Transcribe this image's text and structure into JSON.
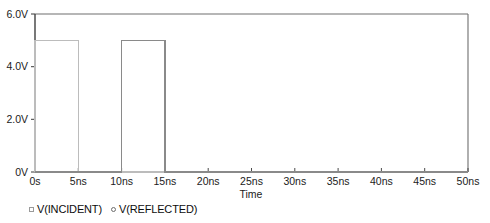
{
  "chart_data": {
    "type": "line",
    "title": "",
    "xlabel": "Time",
    "ylabel": "",
    "xlim": [
      0,
      50
    ],
    "ylim": [
      0,
      6
    ],
    "x_unit": "ns",
    "y_unit": "V",
    "grid": false,
    "legend_position": "bottom-left",
    "x_ticks": [
      0,
      5,
      10,
      15,
      20,
      25,
      30,
      35,
      40,
      45,
      50
    ],
    "x_tick_labels": [
      "0s",
      "5ns",
      "10ns",
      "15ns",
      "20ns",
      "25ns",
      "30ns",
      "35ns",
      "40ns",
      "45ns",
      "50ns"
    ],
    "y_ticks": [
      0,
      2,
      4,
      6
    ],
    "y_tick_labels": [
      "0V",
      "2.0V",
      "4.0V",
      "6.0V"
    ],
    "series": [
      {
        "name": "V(INCIDENT)",
        "marker": "square",
        "color": "#bcbcbc",
        "points": [
          [
            0,
            0
          ],
          [
            0,
            5
          ],
          [
            5,
            5
          ],
          [
            5,
            0
          ],
          [
            50,
            0
          ]
        ]
      },
      {
        "name": "V(REFLECTED)",
        "marker": "circle",
        "color": "#8a8a8a",
        "points": [
          [
            0,
            0
          ],
          [
            10,
            0
          ],
          [
            10,
            5
          ],
          [
            15,
            5
          ],
          [
            15,
            0
          ],
          [
            50,
            0
          ]
        ]
      }
    ]
  },
  "legend": {
    "entries": [
      {
        "label": "V(INCIDENT)",
        "marker": "square"
      },
      {
        "label": "V(REFLECTED)",
        "marker": "circle"
      }
    ]
  },
  "axes": {
    "x_title": "Time"
  },
  "colors": {
    "axis": "#4a4a4a",
    "frame": "#6e6e6e",
    "incident": "#bcbcbc",
    "reflected": "#8a8a8a",
    "text": "#121212",
    "background": "#ffffff"
  }
}
